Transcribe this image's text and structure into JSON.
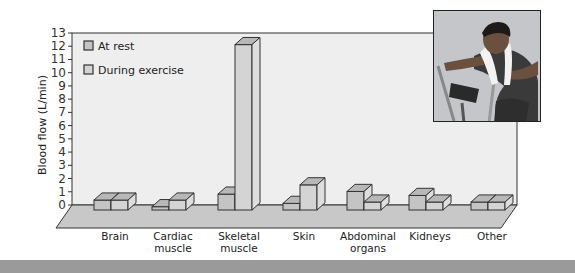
{
  "chart_data": {
    "type": "bar",
    "title": "",
    "xlabel": "",
    "ylabel": "Blood flow (L/min)",
    "ylim": [
      0,
      13
    ],
    "yticks": [
      0,
      1,
      2,
      3,
      4,
      5,
      6,
      7,
      8,
      9,
      10,
      11,
      12,
      13
    ],
    "grid": false,
    "legend_position": "upper-left",
    "style": "3d",
    "categories": [
      "Brain",
      "Cardiac muscle",
      "Skeletal muscle",
      "Skin",
      "Abdominal organs",
      "Kidneys",
      "Other"
    ],
    "category_lines": [
      [
        "Brain"
      ],
      [
        "Cardiac",
        "muscle"
      ],
      [
        "Skeletal",
        "muscle"
      ],
      [
        "Skin"
      ],
      [
        "Abdominal",
        "organs"
      ],
      [
        "Kidneys"
      ],
      [
        "Other"
      ]
    ],
    "series": [
      {
        "name": "At rest",
        "color": "#c4c4c4",
        "values": [
          0.75,
          0.25,
          1.2,
          0.5,
          1.4,
          1.1,
          0.6
        ]
      },
      {
        "name": "During exercise",
        "color": "#d4d4d4",
        "values": [
          0.75,
          0.75,
          12.5,
          1.9,
          0.6,
          0.6,
          0.6
        ]
      }
    ]
  },
  "legend": {
    "items": [
      {
        "label": "At rest"
      },
      {
        "label": "During exercise"
      }
    ]
  },
  "photo": {
    "description": "woman exercising on stationary bike with towel around neck"
  },
  "colors": {
    "wall": "#eeeeee",
    "floor": "#c8c8c8",
    "outline": "#333333",
    "band": "#9a9a9a"
  }
}
